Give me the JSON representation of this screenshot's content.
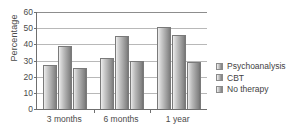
{
  "chart_data": {
    "type": "bar",
    "title": "",
    "xlabel": "",
    "ylabel": "Percentage",
    "categories": [
      "3 months",
      "6 months",
      "1 year"
    ],
    "series": [
      {
        "name": "Psychoanalysis",
        "values": [
          27,
          31.5,
          51
        ]
      },
      {
        "name": "CBT",
        "values": [
          39,
          45,
          46
        ]
      },
      {
        "name": "No therapy",
        "values": [
          25.5,
          30,
          29
        ]
      }
    ],
    "ylim": [
      0,
      60
    ],
    "yticks": [
      0,
      10,
      20,
      30,
      40,
      50,
      60
    ],
    "ytick_labels": [
      "0",
      "10",
      "20",
      "30",
      "40",
      "50",
      "60"
    ],
    "grid": true,
    "legend_position": "right"
  },
  "legend": {
    "items": [
      {
        "label": "Psychoanalysis",
        "swatch": "legend-swatch-psychoanalysis"
      },
      {
        "label": "CBT",
        "swatch": "legend-swatch-cbt"
      },
      {
        "label": "No therapy",
        "swatch": "legend-swatch-no-therapy"
      }
    ]
  },
  "colors": {
    "background": "#ffffff",
    "axis": "#6f6f6f",
    "gridline": "#b8b8b8",
    "text": "#4a4a4a",
    "bar_light": "#f0f0f0",
    "bar_dark": "#717171"
  }
}
